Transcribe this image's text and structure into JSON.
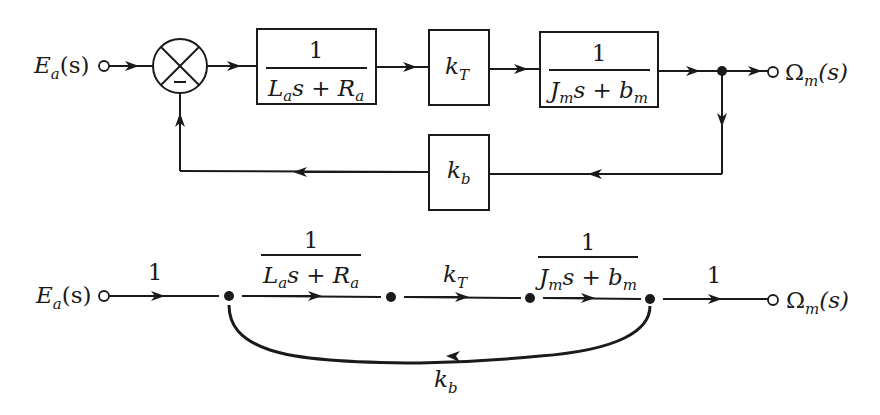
{
  "block_diagram": {
    "input": {
      "base": "E",
      "sub": "a",
      "arg": "(s)"
    },
    "output": {
      "base": "Ω",
      "sub": "m",
      "arg": "(s)"
    },
    "summing_junction": {
      "sign": "−"
    },
    "blocks": [
      {
        "name": "armature",
        "num": "1",
        "den_l": "L",
        "den_l_sub": "a",
        "den_mid": "s + ",
        "den_r": "R",
        "den_r_sub": "a"
      },
      {
        "name": "torque-constant",
        "base": "k",
        "sub": "T"
      },
      {
        "name": "mechanical",
        "num": "1",
        "den_l": "J",
        "den_l_sub": "m",
        "den_mid": "s + ",
        "den_r": "b",
        "den_r_sub": "m"
      },
      {
        "name": "back-emf",
        "base": "k",
        "sub": "b"
      }
    ]
  },
  "signal_flow_graph": {
    "input": {
      "base": "E",
      "sub": "a",
      "arg": "(s)"
    },
    "output": {
      "base": "Ω",
      "sub": "m",
      "arg": "(s)"
    },
    "branches": [
      {
        "gain": "1"
      },
      {
        "num": "1",
        "den_l": "L",
        "den_l_sub": "a",
        "den_mid": "s + ",
        "den_r": "R",
        "den_r_sub": "a"
      },
      {
        "base": "k",
        "sub": "T"
      },
      {
        "num": "1",
        "den_l": "J",
        "den_l_sub": "m",
        "den_mid": "s + ",
        "den_r": "b",
        "den_r_sub": "m"
      },
      {
        "gain": "1"
      }
    ],
    "feedback": {
      "base": "k",
      "sub": "b"
    }
  }
}
